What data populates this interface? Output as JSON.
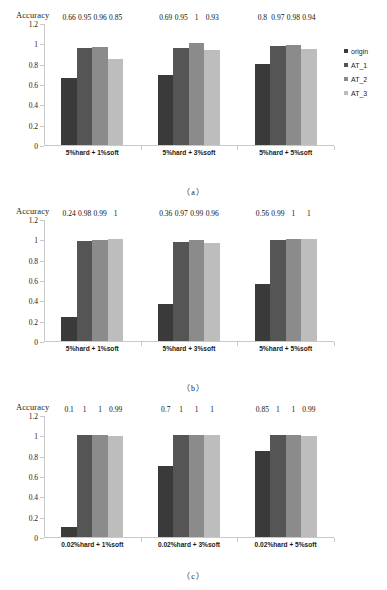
{
  "figure": {
    "axis_title": "Accuracy",
    "y_ticks": [
      "0",
      "0.2",
      "0.4",
      "0.6",
      "0.8",
      "1",
      "1.2"
    ],
    "captions": {
      "a": "（a）",
      "b": "（b）",
      "c": "（c）"
    }
  },
  "legend": {
    "items": [
      {
        "label": "origin",
        "color": "#3a3a3a"
      },
      {
        "label": "AT_1",
        "color": "#555555"
      },
      {
        "label": "AT_2",
        "color": "#8b8b8b"
      },
      {
        "label": "AT_3",
        "color": "#bdbdbd"
      }
    ]
  },
  "chart_data": [
    {
      "type": "bar",
      "panel": "a",
      "title": "Accuracy",
      "xlabel": "",
      "ylabel": "Accuracy",
      "ylim": [
        0,
        1.2
      ],
      "yticks": [
        0,
        0.2,
        0.4,
        0.6,
        0.8,
        1,
        1.2
      ],
      "grid": false,
      "legend_position": "right",
      "categories": [
        "5%hard + 1%soft",
        "5%hard + 3%soft",
        "5%hard + 5%soft"
      ],
      "series": [
        {
          "name": "origin",
          "color": "#3a3a3a",
          "values": [
            0.66,
            0.69,
            0.8
          ],
          "labels": [
            "0.66",
            "0.69",
            "0.8"
          ]
        },
        {
          "name": "AT_1",
          "color": "#555555",
          "values": [
            0.95,
            0.95,
            0.97
          ],
          "labels": [
            "0.95",
            "0.95",
            "0.97"
          ]
        },
        {
          "name": "AT_2",
          "color": "#8b8b8b",
          "values": [
            0.96,
            1,
            0.98
          ],
          "labels": [
            "0.96",
            "1",
            "0.98"
          ]
        },
        {
          "name": "AT_3",
          "color": "#bdbdbd",
          "values": [
            0.85,
            0.93,
            0.94
          ],
          "labels": [
            "0.85",
            "0.93",
            "0.94"
          ]
        }
      ]
    },
    {
      "type": "bar",
      "panel": "b",
      "title": "Accuracy",
      "xlabel": "",
      "ylabel": "Accuracy",
      "ylim": [
        0,
        1.2
      ],
      "yticks": [
        0,
        0.2,
        0.4,
        0.6,
        0.8,
        1,
        1.2
      ],
      "grid": false,
      "legend_position": "none",
      "categories": [
        "5%hard + 1%soft",
        "5%hard + 3%soft",
        "5%hard + 5%soft"
      ],
      "series": [
        {
          "name": "origin",
          "color": "#3a3a3a",
          "values": [
            0.24,
            0.36,
            0.56
          ],
          "labels": [
            "0.24",
            "0.36",
            "0.56"
          ]
        },
        {
          "name": "AT_1",
          "color": "#555555",
          "values": [
            0.98,
            0.97,
            0.99
          ],
          "labels": [
            "0.98",
            "0.97",
            "0.99"
          ]
        },
        {
          "name": "AT_2",
          "color": "#8b8b8b",
          "values": [
            0.99,
            0.99,
            1
          ],
          "labels": [
            "0.99",
            "0.99",
            "1"
          ]
        },
        {
          "name": "AT_3",
          "color": "#bdbdbd",
          "values": [
            1,
            0.96,
            1
          ],
          "labels": [
            "1",
            "0.96",
            "1"
          ]
        }
      ]
    },
    {
      "type": "bar",
      "panel": "c",
      "title": "Accuracy",
      "xlabel": "",
      "ylabel": "Accuracy",
      "ylim": [
        0,
        1.2
      ],
      "yticks": [
        0,
        0.2,
        0.4,
        0.6,
        0.8,
        1,
        1.2
      ],
      "grid": false,
      "legend_position": "none",
      "categories": [
        "0.02%hard + 1%soft",
        "0.02%hard + 3%soft",
        "0.02%hard + 5%soft"
      ],
      "series": [
        {
          "name": "origin",
          "color": "#3a3a3a",
          "values": [
            0.1,
            0.7,
            0.85
          ],
          "labels": [
            "0.1",
            "0.7",
            "0.85"
          ]
        },
        {
          "name": "AT_1",
          "color": "#555555",
          "values": [
            1,
            1,
            1
          ],
          "labels": [
            "1",
            "1",
            "1"
          ]
        },
        {
          "name": "AT_2",
          "color": "#8b8b8b",
          "values": [
            1,
            1,
            1
          ],
          "labels": [
            "1",
            "1",
            "1"
          ]
        },
        {
          "name": "AT_3",
          "color": "#bdbdbd",
          "values": [
            0.99,
            1,
            0.99
          ],
          "labels": [
            "0.99",
            "1",
            "0.99"
          ]
        }
      ]
    }
  ]
}
